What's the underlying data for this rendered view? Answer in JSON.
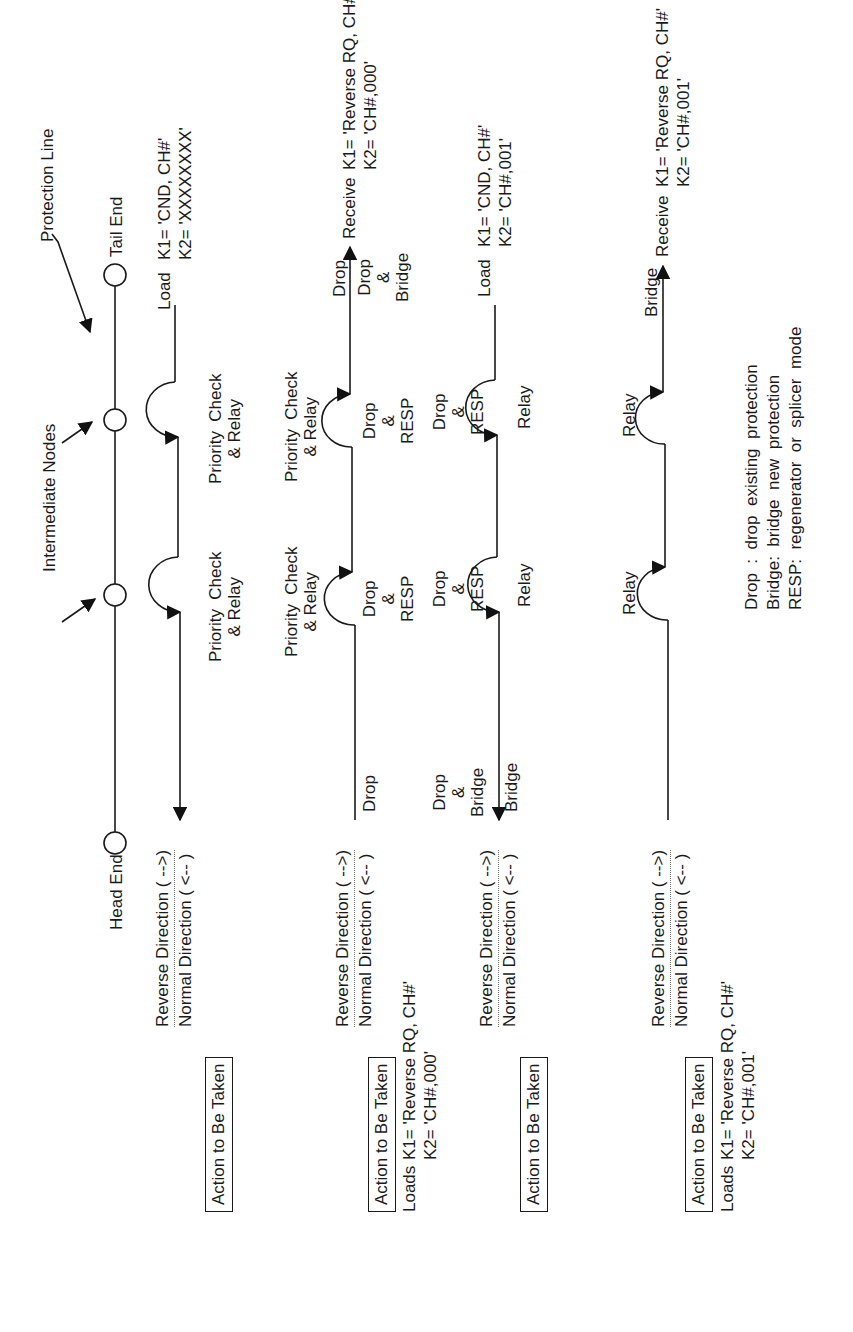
{
  "topology": {
    "protection_line_label": "Protection Line",
    "intermediate_nodes_label": "Intermediate Nodes",
    "head_end_label": "Head End",
    "tail_end_label": "Tail End"
  },
  "direction_labels": {
    "reverse": "Reverse  Direction  ( -->)",
    "normal": "Normal  Direction  ( <-- )"
  },
  "action_label": "Action to Be Taken",
  "rows": [
    {
      "tail_text": {
        "verb": "Load",
        "k1": "K1= 'CND, CH#'",
        "k2": "K2= 'XXXXXXXX'"
      },
      "node_labels": [
        {
          "line1": "Priority  Check",
          "line2": "& Relay"
        },
        {
          "line1": "Priority  Check",
          "line2": "& Relay"
        }
      ]
    },
    {
      "head_text": {
        "verb": "Loads",
        "k1": "K1= 'Reverse RQ, CH#'",
        "k2": "K2= 'CH#,000'"
      },
      "tail_text": {
        "verb": "Receive",
        "k1": "K1= 'Reverse RQ, CH#'",
        "k2": "K2= 'CH#,000'"
      },
      "above_labels": [
        {
          "line1": "Priority  Check",
          "line2": "& Relay"
        },
        {
          "line1": "Priority  Check",
          "line2": "& Relay"
        }
      ],
      "head_label": "Drop",
      "node_labels": [
        {
          "line1": "Drop",
          "line2": "&",
          "line3": "RESP"
        },
        {
          "line1": "Drop",
          "line2": "&",
          "line3": "RESP"
        }
      ],
      "tail_label_above": "Drop",
      "tail_label_below": {
        "line1": "Drop",
        "line2": "&",
        "line3": "Bridge"
      }
    },
    {
      "tail_text": {
        "verb": "Load",
        "k1": "K1= 'CND, CH#'",
        "k2": "K2= 'CH#,001'"
      },
      "above_labels": [
        {
          "line1": "Drop",
          "line2": "&",
          "line3": "Bridge"
        },
        {
          "line1": "Drop",
          "line2": "&",
          "line3": "RESP"
        },
        {
          "line1": "Drop",
          "line2": "&",
          "line3": "RESP"
        }
      ],
      "head_label": "Bridge",
      "node_labels": [
        "Relay",
        "Relay"
      ]
    },
    {
      "head_text": {
        "verb": "Loads",
        "k1": "K1= 'Reverse RQ, CH#'",
        "k2": "K2= 'CH#,001'"
      },
      "tail_text": {
        "verb": "Receive",
        "k1": "K1= 'Reverse RQ, CH#'",
        "k2": "K2= 'CH#,001'"
      },
      "above_labels": [
        "Relay",
        "Relay"
      ],
      "tail_label": "Bridge"
    }
  ],
  "legend": [
    "Drop  :  drop  existing  protection",
    "Bridge:  bridge  new  protection",
    "RESP:  regenerator  or  splicer  mode"
  ]
}
